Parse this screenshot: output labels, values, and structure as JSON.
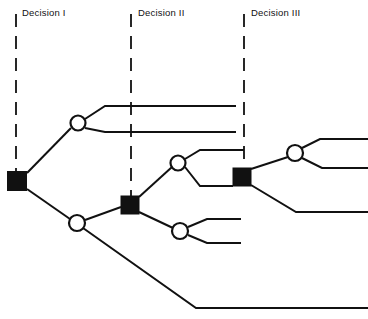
{
  "diagram": {
    "type": "decision-tree",
    "width": 368,
    "height": 319,
    "colors": {
      "background": "#ffffff",
      "stroke": "#111111",
      "node_fill": "#111111",
      "chance_fill": "#ffffff",
      "text": "#111111"
    },
    "stage_labels": [
      {
        "id": "decision-1",
        "text": "Decision I",
        "x": 22,
        "y": 8,
        "divider_x": 16
      },
      {
        "id": "decision-2",
        "text": "Decision II",
        "x": 138,
        "y": 8,
        "divider_x": 131
      },
      {
        "id": "decision-3",
        "text": "Decision III",
        "x": 251,
        "y": 8,
        "divider_x": 244
      }
    ],
    "dividers": [
      {
        "id": "divider-decision-1",
        "x": 16,
        "y1": 14,
        "y2": 176
      },
      {
        "id": "divider-decision-2",
        "x": 131,
        "y1": 14,
        "y2": 198
      },
      {
        "id": "divider-decision-3",
        "x": 244,
        "y1": 14,
        "y2": 170
      }
    ],
    "decision_nodes": [
      {
        "id": "decision-node-1",
        "stage": "Decision I",
        "cx": 17,
        "cy": 181,
        "size": 19
      },
      {
        "id": "decision-node-2",
        "stage": "Decision II",
        "cx": 130,
        "cy": 205,
        "size": 18
      },
      {
        "id": "decision-node-3",
        "stage": "Decision III",
        "cx": 242,
        "cy": 177,
        "size": 18
      }
    ],
    "chance_nodes": [
      {
        "id": "chance-node-top",
        "cx": 78,
        "cy": 123,
        "r": 7.5
      },
      {
        "id": "chance-node-bottom-left",
        "cx": 77,
        "cy": 223,
        "r": 8
      },
      {
        "id": "chance-node-mid-upper",
        "cx": 178,
        "cy": 163,
        "r": 7.5
      },
      {
        "id": "chance-node-mid-lower",
        "cx": 180,
        "cy": 231,
        "r": 8
      },
      {
        "id": "chance-node-right",
        "cx": 295,
        "cy": 153,
        "r": 8
      }
    ],
    "branches": [
      {
        "id": "branch-d1-to-chance-top",
        "points": "27,173 71,128"
      },
      {
        "id": "branch-d1-to-chance-bottomleft",
        "points": "27,189 70,219"
      },
      {
        "id": "branch-chance-top-upper",
        "points": "85,119 105,106 236,106"
      },
      {
        "id": "branch-chance-top-lower",
        "points": "85,128 105,132 236,132"
      },
      {
        "id": "branch-chance-bottomleft-to-d2",
        "points": "85,220 121,207"
      },
      {
        "id": "branch-chance-bottomleft-long",
        "points": "83,228 196,308 368,308"
      },
      {
        "id": "branch-d2-to-chance-midupper",
        "points": "139,197 172,167"
      },
      {
        "id": "branch-d2-to-chance-midlower",
        "points": "139,212 173,228"
      },
      {
        "id": "branch-chance-midupper-upper",
        "points": "185,159 200,150 244,150"
      },
      {
        "id": "branch-chance-midupper-to-d3",
        "points": "185,167 200,186 233,186"
      },
      {
        "id": "branch-chance-midlower-upper",
        "points": "188,227 207,219 241,219"
      },
      {
        "id": "branch-chance-midlower-lower",
        "points": "188,235 207,243 241,243"
      },
      {
        "id": "branch-d3-to-chance-right",
        "points": "251,169 288,157"
      },
      {
        "id": "branch-d3-lower",
        "points": "251,185 296,212 368,212"
      },
      {
        "id": "branch-chance-right-upper",
        "points": "302,148 320,139 368,139"
      },
      {
        "id": "branch-chance-right-lower",
        "points": "302,158 322,168 368,168"
      }
    ]
  }
}
